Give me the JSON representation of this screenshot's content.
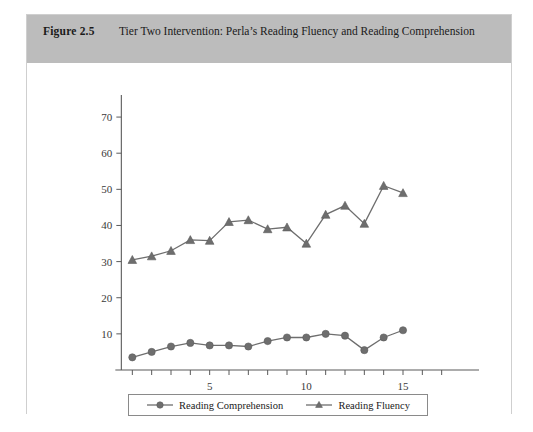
{
  "figure": {
    "number": "Figure 2.5",
    "title": "Tier Two Intervention: Perla’s Reading Fluency and Reading Comprehension"
  },
  "legend": {
    "items": [
      {
        "label": "Reading Comprehension",
        "marker": "circle",
        "color": "#6e6e6e"
      },
      {
        "label": "Reading Fluency",
        "marker": "triangle",
        "color": "#6e6e6e"
      }
    ]
  },
  "colors": {
    "header_background": "#bcbcbc",
    "frame_border": "#cfcfcf",
    "series": "#6e6e6e",
    "axis": "#5a5a5a",
    "text": "#1a1a1a"
  },
  "chart_data": {
    "type": "line",
    "title": "Tier Two Intervention: Perla’s Reading Fluency and Reading Comprehension",
    "xlabel": "",
    "ylabel": "",
    "xlim": [
      0,
      18
    ],
    "ylim": [
      0,
      75
    ],
    "xticks": [
      1,
      2,
      3,
      4,
      5,
      6,
      7,
      8,
      9,
      10,
      11,
      12,
      13,
      14,
      15,
      16,
      17
    ],
    "xticklabels": [
      "",
      "",
      "",
      "",
      "5",
      "",
      "",
      "",
      "",
      "10",
      "",
      "",
      "",
      "",
      "15",
      "",
      ""
    ],
    "yticks": [
      10,
      20,
      30,
      40,
      50,
      60,
      70
    ],
    "yticklabels": [
      "10",
      "20",
      "30",
      "40",
      "50",
      "60",
      "70"
    ],
    "grid": false,
    "legend_position": "bottom",
    "x": [
      1,
      2,
      3,
      4,
      5,
      6,
      7,
      8,
      9,
      10,
      11,
      12,
      13,
      14,
      15
    ],
    "series": [
      {
        "name": "Reading Comprehension",
        "marker": "circle",
        "values": [
          3.5,
          5,
          6.5,
          7.5,
          6.8,
          6.8,
          6.5,
          8,
          9,
          9,
          10,
          9.5,
          5.5,
          9,
          11
        ]
      },
      {
        "name": "Reading Fluency",
        "marker": "triangle",
        "values": [
          30.5,
          31.5,
          33,
          36,
          35.8,
          41,
          41.5,
          39,
          39.5,
          35,
          43,
          45.5,
          40.5,
          51,
          49
        ]
      }
    ]
  }
}
